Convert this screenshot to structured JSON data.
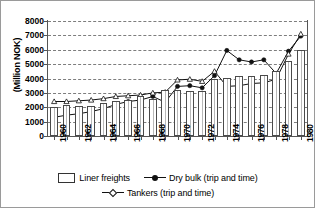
{
  "chart_data": {
    "type": "bar",
    "title": "",
    "subtitle": "",
    "xlabel": "",
    "ylabel": "(Million NOK)",
    "ylim": [
      0,
      8000
    ],
    "ytick_values": [
      0,
      1000,
      2000,
      3000,
      4000,
      5000,
      6000,
      7000,
      8000
    ],
    "ytick_labels": [
      "0",
      "1000",
      "2000",
      "3000",
      "4000",
      "5000",
      "6000",
      "7000",
      "8000"
    ],
    "grid": true,
    "legend_position": "below",
    "categories": [
      1960,
      1961,
      1962,
      1963,
      1964,
      1965,
      1966,
      1967,
      1968,
      1969,
      1970,
      1971,
      1972,
      1973,
      1974,
      1975,
      1976,
      1977,
      1978,
      1979,
      1980
    ],
    "xtick_labels": [
      "1960",
      "1962",
      "1964",
      "1966",
      "1968",
      "1970",
      "1972",
      "1974",
      "1976",
      "1978",
      "1980"
    ],
    "xtick_values": [
      1960,
      1962,
      1964,
      1966,
      1968,
      1970,
      1972,
      1974,
      1976,
      1978,
      1980
    ],
    "series": [
      {
        "name": "Liner freights",
        "kind": "bar",
        "marker": "none",
        "values": [
          2050,
          2150,
          2080,
          2100,
          2300,
          2450,
          2500,
          2750,
          2550,
          3200,
          3200,
          3150,
          3150,
          3950,
          4050,
          4150,
          4200,
          4250,
          4500,
          5200,
          6000
        ]
      },
      {
        "name": "Dry bulk (trip and time)",
        "kind": "line",
        "marker": "filled-circle",
        "values": [
          1300,
          1450,
          1550,
          1700,
          1900,
          2200,
          2400,
          2500,
          2750,
          2350,
          3450,
          3500,
          3350,
          4200,
          5950,
          5300,
          5150,
          5300,
          4350,
          5900,
          6950
        ]
      },
      {
        "name": "Tankers (trip and time)",
        "kind": "line",
        "marker": "open-triangle",
        "values": [
          2400,
          2400,
          2450,
          2500,
          2600,
          2750,
          2800,
          2850,
          3000,
          3050,
          3900,
          3950,
          3800,
          4500,
          3450,
          3500,
          3650,
          3700,
          3950,
          5700,
          7100
        ]
      }
    ]
  },
  "legend": {
    "items": [
      {
        "label": "Liner freights",
        "marker": "bar-swatch"
      },
      {
        "label": "Dry bulk (trip and time)",
        "marker": "filled-circle"
      },
      {
        "label": "Tankers (trip and time)",
        "marker": "open-triangle"
      }
    ]
  }
}
